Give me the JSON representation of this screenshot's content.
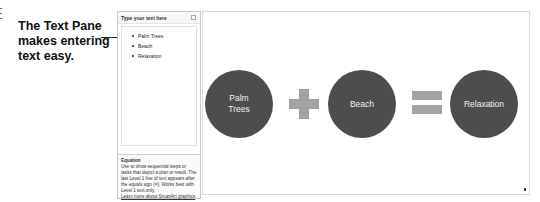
{
  "callout": {
    "line1": "The Text Pane",
    "line2": "makes entering",
    "line3": "text easy."
  },
  "text_pane": {
    "title": "Type your text here",
    "close_icon": "close-icon",
    "items": [
      "Palm Trees",
      "Beach",
      "Relaxation"
    ],
    "description": {
      "title": "Equation",
      "body": "Use to show sequential steps or tasks that depict a plan or result. The last Level 1 line of text appears after the equals sign (=). Works best with Level 1 text only.",
      "link": "Learn more about SmartArt graphics"
    }
  },
  "smartart": {
    "layout": "Equation",
    "shapes": [
      {
        "label_line1": "Palm",
        "label_line2": "Trees"
      },
      {
        "operator": "plus"
      },
      {
        "label_line1": "Beach",
        "label_line2": ""
      },
      {
        "operator": "equals"
      },
      {
        "label_line1": "Relaxation",
        "label_line2": ""
      }
    ],
    "circle_color": "#4d4d4d",
    "operator_color": "#a3a3a3"
  }
}
